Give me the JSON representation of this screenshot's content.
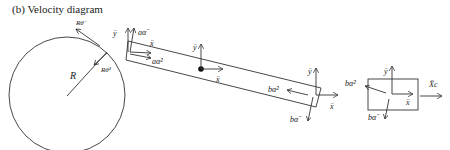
{
  "title": "(b) Velocity diagram",
  "wheel": {
    "radius_label": "R",
    "tangential_label": "Rθ̈",
    "centripetal_label": "Rθ̇²"
  },
  "bar": {
    "left_end": {
      "y_label": "ÿ",
      "tangential_label": "aα̈",
      "x_label": "ẍ",
      "centripetal_label": "aα̇²"
    },
    "center": {
      "y_label": "ÿ",
      "x_label": "ẍ"
    },
    "right_end": {
      "y_label": "ÿ",
      "x_label": "ẍ",
      "centripetal_label": "bα̇²",
      "tangential_label": "bα̈"
    }
  },
  "block": {
    "y_label": "ÿ",
    "x_label": "ẍ",
    "centripetal_label": "bα̇²",
    "tangential_label": "bα̈",
    "xc_label": "Ẍc"
  }
}
